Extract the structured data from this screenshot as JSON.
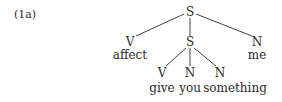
{
  "example_label": "(1a)",
  "tree": {
    "root": {
      "label": "S"
    },
    "children": [
      {
        "label": "V",
        "word": "affect"
      },
      {
        "label": "S",
        "children": [
          {
            "label": "V",
            "word": "give"
          },
          {
            "label": "N",
            "word": "you"
          },
          {
            "label": "N",
            "word": "something"
          }
        ]
      },
      {
        "label": "N",
        "word": "me"
      }
    ]
  }
}
